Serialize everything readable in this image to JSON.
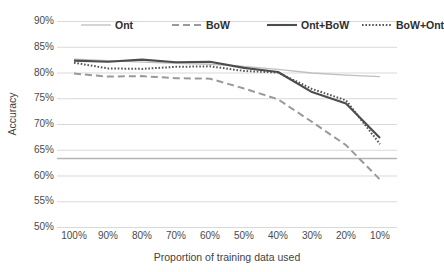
{
  "chart_data": {
    "type": "line",
    "title": "",
    "xlabel": "Proportion of training data used",
    "ylabel": "Accuracy",
    "categories": [
      "100%",
      "90%",
      "80%",
      "70%",
      "60%",
      "50%",
      "40%",
      "30%",
      "20%",
      "10%"
    ],
    "x_values": [
      100,
      90,
      80,
      70,
      60,
      50,
      40,
      30,
      20,
      10
    ],
    "ylim": [
      50,
      90
    ],
    "yticks": [
      "50%",
      "55%",
      "60%",
      "65%",
      "70%",
      "75%",
      "80%",
      "85%",
      "90%"
    ],
    "ytick_values": [
      50,
      55,
      60,
      65,
      70,
      75,
      80,
      85,
      90
    ],
    "grid": "horizontal",
    "legend_position": "top",
    "series": [
      {
        "name": "Ont",
        "style": "thin-solid-light",
        "color": "#bfbfbf",
        "values": [
          82.6,
          82.3,
          82.0,
          81.8,
          81.6,
          81.2,
          80.6,
          79.9,
          79.5,
          79.2
        ]
      },
      {
        "name": "BoW",
        "style": "dashed",
        "color": "#9a9a9a",
        "values": [
          79.8,
          79.2,
          79.3,
          78.9,
          78.8,
          76.9,
          74.8,
          70.4,
          65.9,
          59.2
        ]
      },
      {
        "name": "Ont+BoW",
        "style": "thick-solid",
        "color": "#4d4d4d",
        "values": [
          82.3,
          82.1,
          82.5,
          82.0,
          82.1,
          80.9,
          80.1,
          76.2,
          74.0,
          67.3
        ]
      },
      {
        "name": "BoW+Ont",
        "style": "dotted",
        "color": "#555555",
        "values": [
          81.9,
          80.8,
          80.7,
          81.1,
          81.2,
          80.3,
          80.0,
          76.8,
          74.6,
          66.1
        ]
      }
    ],
    "baseline": {
      "name": "baseline",
      "value": 63.3,
      "color": "#b5b5b5",
      "style": "solid-horizontal"
    }
  }
}
